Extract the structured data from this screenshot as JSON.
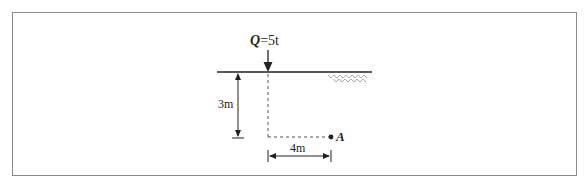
{
  "diagram": {
    "load": {
      "symbol": "Q",
      "equals": "=",
      "value": "5t"
    },
    "depth_dimension": "3m",
    "horizontal_dimension": "4m",
    "point_label": "A",
    "colors": {
      "line": "#222222",
      "dashed": "#555555",
      "border": "#8a8a8a",
      "hatch": "#999999"
    }
  }
}
